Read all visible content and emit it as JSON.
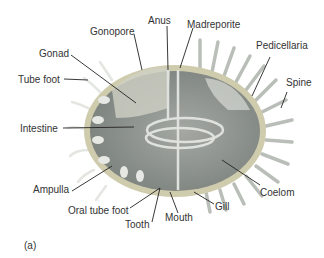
{
  "figure": {
    "panel_label": "(a)",
    "labels": {
      "gonopore": "Gonopore",
      "anus": "Anus",
      "madreporite": "Madreporite",
      "gonad": "Gonad",
      "pedicellaria": "Pedicellaria",
      "tube_foot": "Tube foot",
      "spine": "Spine",
      "intestine": "Intestine",
      "ampulla": "Ampulla",
      "coelom": "Coelom",
      "oral_tube_foot": "Oral tube foot",
      "gill": "Gill",
      "mouth": "Mouth",
      "tooth": "Tooth"
    },
    "colors": {
      "body_fill": "#8f9590",
      "body_rim": "#c9c5a8",
      "spine": "#b7bcb6",
      "label_line": "#222222"
    }
  }
}
